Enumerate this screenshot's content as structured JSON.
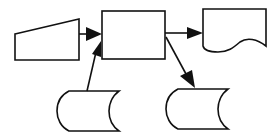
{
  "diagram": {
    "type": "flowchart",
    "colors": {
      "stroke": "#111111",
      "fill": "#ffffff",
      "background": "#ffffff"
    },
    "nodes": [
      {
        "id": "manual-input",
        "shape": "manual-input-trapezoid",
        "label": ""
      },
      {
        "id": "process",
        "shape": "rectangle",
        "label": ""
      },
      {
        "id": "document",
        "shape": "document",
        "label": ""
      },
      {
        "id": "stored-data-left",
        "shape": "stored-data",
        "label": ""
      },
      {
        "id": "stored-data-right",
        "shape": "stored-data",
        "label": ""
      }
    ],
    "edges": [
      {
        "from": "manual-input",
        "to": "process"
      },
      {
        "from": "stored-data-left",
        "to": "process"
      },
      {
        "from": "process",
        "to": "document"
      },
      {
        "from": "process",
        "to": "stored-data-right"
      }
    ]
  }
}
